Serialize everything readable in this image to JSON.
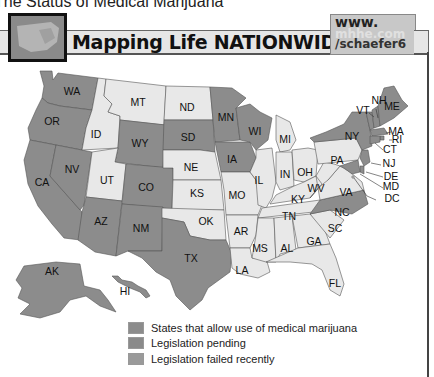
{
  "caption": "The Status of Medical Marijuana",
  "header": {
    "title": "Mapping Life NATIONWIDE",
    "url_line1": "www.",
    "url_line2": "mhhe.com",
    "url_line3": "/schaefer6",
    "thumbnail_icon": "us-map-thumbnail-icon"
  },
  "colors": {
    "allow": "#8c8c8c",
    "pending": "#8a8a8a",
    "failed": "#9a9a9a",
    "none": "#e8e8e8",
    "border": "#555555"
  },
  "legend": [
    {
      "key": "allow",
      "label": "States that allow use of medical marijuana"
    },
    {
      "key": "pending",
      "label": "Legislation pending"
    },
    {
      "key": "failed",
      "label": "Legislation failed recently"
    }
  ],
  "states": {
    "WA": "allow",
    "OR": "allow",
    "CA": "allow",
    "NV": "allow",
    "AZ": "allow",
    "NM": "allow",
    "CO": "allow",
    "WY": "allow",
    "SD": "allow",
    "MN": "allow",
    "WI": "allow",
    "IA": "allow",
    "TX": "allow",
    "AK": "allow",
    "HI": "allow",
    "NY": "allow",
    "VT": "allow",
    "NH": "allow",
    "ME": "allow",
    "MA": "allow",
    "RI": "allow",
    "CT": "allow",
    "NJ": "allow",
    "MD": "allow",
    "NC": "allow",
    "DE": "allow",
    "MT": "none",
    "ID": "none",
    "ND": "none",
    "NE": "none",
    "UT": "none",
    "KS": "none",
    "OK": "none",
    "MO": "none",
    "AR": "none",
    "LA": "none",
    "MS": "none",
    "AL": "none",
    "GA": "none",
    "FL": "none",
    "SC": "none",
    "TN": "none",
    "KY": "none",
    "IL": "none",
    "IN": "none",
    "OH": "none",
    "MI": "none",
    "PA": "none",
    "WV": "none",
    "VA": "none",
    "DC": "none"
  },
  "labels": {
    "WA": "WA",
    "OR": "OR",
    "CA": "CA",
    "NV": "NV",
    "ID": "ID",
    "MT": "MT",
    "WY": "WY",
    "UT": "UT",
    "AZ": "AZ",
    "CO": "CO",
    "NM": "NM",
    "ND": "ND",
    "SD": "SD",
    "NE": "NE",
    "KS": "KS",
    "OK": "OK",
    "TX": "TX",
    "MN": "MN",
    "IA": "IA",
    "MO": "MO",
    "AR": "AR",
    "LA": "LA",
    "WI": "WI",
    "IL": "IL",
    "MI": "MI",
    "IN": "IN",
    "OH": "OH",
    "KY": "KY",
    "TN": "TN",
    "MS": "MS",
    "AL": "AL",
    "GA": "GA",
    "FL": "FL",
    "SC": "SC",
    "NC": "NC",
    "VA": "VA",
    "WV": "WV",
    "PA": "PA",
    "NY": "NY",
    "VT": "VT",
    "NH": "NH",
    "ME": "ME",
    "MA": "MA",
    "RI": "RI",
    "CT": "CT",
    "NJ": "NJ",
    "DE": "DE",
    "MD": "MD",
    "DC": "DC",
    "AK": "AK",
    "HI": "HI"
  }
}
